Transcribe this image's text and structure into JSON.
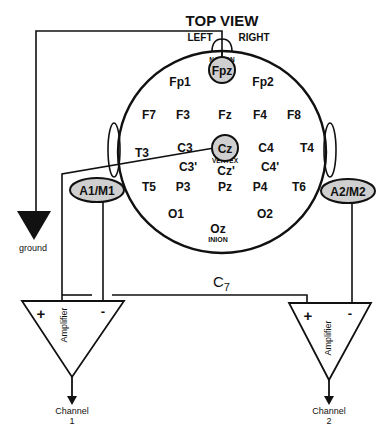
{
  "title": "TOP VIEW",
  "orientation": {
    "left": "LEFT",
    "right": "RIGHT"
  },
  "landmarks": {
    "nasion": "NASION",
    "vertex": "VERTEX",
    "inion": "INION"
  },
  "electrodes": {
    "fpz": "Fpz",
    "fp1": "Fp1",
    "fp2": "Fp2",
    "f7": "F7",
    "f3": "F3",
    "fz": "Fz",
    "f4": "F4",
    "f8": "F8",
    "t3": "T3",
    "c3": "C3",
    "cz": "Cz",
    "c4": "C4",
    "t4": "T4",
    "c3p": "C3'",
    "czp": "Cz'",
    "c4p": "C4'",
    "t5": "T5",
    "p3": "P3",
    "pz": "Pz",
    "p4": "P4",
    "t6": "T6",
    "o1": "O1",
    "oz": "Oz",
    "o2": "O2"
  },
  "references": {
    "left": "A1/M1",
    "right": "A2/M2"
  },
  "ground_label": "ground",
  "cervical_label": {
    "base": "C",
    "sub": "7"
  },
  "amplifiers": [
    {
      "label": "Amplifier",
      "plus": "+",
      "minus": "-",
      "channel_line1": "Channel",
      "channel_line2": "1"
    },
    {
      "label": "Amplifier",
      "plus": "+",
      "minus": "-",
      "channel_line1": "Channel",
      "channel_line2": "2"
    }
  ],
  "colors": {
    "line": "#111111",
    "highlight_fill": "#cfcfcf",
    "background": "#ffffff"
  }
}
